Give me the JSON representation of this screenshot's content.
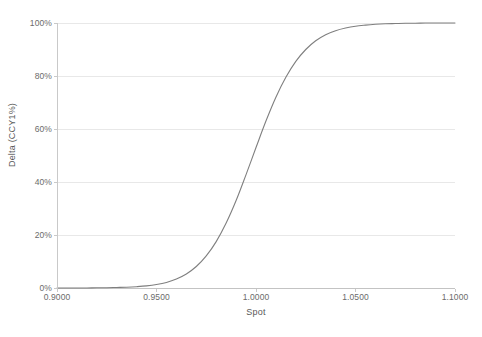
{
  "chart_data": {
    "type": "line",
    "title": "",
    "subtitle": "",
    "xlabel": "Spot",
    "ylabel": "Delta (CCY1%)",
    "xlim": [
      0.9,
      1.1
    ],
    "ylim": [
      0,
      1
    ],
    "grid": true,
    "grid_axis": "y",
    "legend": false,
    "legend_position": "none",
    "line_color": "#7f7f7f",
    "xtick_labels": [
      "0.9000",
      "0.9500",
      "1.0000",
      "1.0500",
      "1.1000"
    ],
    "xtick_values": [
      0.9,
      0.95,
      1.0,
      1.05,
      1.1
    ],
    "ytick_labels": [
      "0%",
      "20%",
      "40%",
      "60%",
      "80%",
      "100%"
    ],
    "ytick_values": [
      0,
      0.2,
      0.4,
      0.6,
      0.8,
      1.0
    ],
    "series": [
      {
        "name": "Delta (CCY1%)",
        "x": [
          0.9,
          0.905,
          0.91,
          0.915,
          0.92,
          0.925,
          0.93,
          0.935,
          0.94,
          0.945,
          0.95,
          0.955,
          0.96,
          0.965,
          0.97,
          0.975,
          0.98,
          0.985,
          0.99,
          0.995,
          1.0,
          1.005,
          1.01,
          1.015,
          1.02,
          1.025,
          1.03,
          1.035,
          1.04,
          1.045,
          1.05,
          1.055,
          1.06,
          1.065,
          1.07,
          1.075,
          1.08,
          1.085,
          1.09,
          1.095,
          1.1
        ],
        "values": [
          0.0,
          0.0,
          0.0,
          0.0,
          0.001,
          0.001,
          0.002,
          0.003,
          0.005,
          0.008,
          0.013,
          0.021,
          0.034,
          0.053,
          0.081,
          0.121,
          0.175,
          0.245,
          0.33,
          0.428,
          0.53,
          0.63,
          0.72,
          0.795,
          0.855,
          0.9,
          0.933,
          0.956,
          0.971,
          0.981,
          0.988,
          0.992,
          0.995,
          0.997,
          0.998,
          0.999,
          0.999,
          1.0,
          1.0,
          1.0,
          1.0
        ]
      }
    ],
    "annotations": []
  }
}
